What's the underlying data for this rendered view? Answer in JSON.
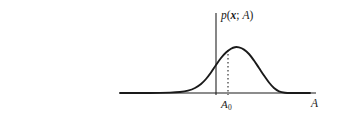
{
  "figure": {
    "kind": "probability-density-plot",
    "background_color": "#ffffff",
    "ink_color": "#1a1a1a",
    "labels": {
      "density_prefix": "p",
      "density_open_paren": "(",
      "density_variable": "x",
      "density_separator": "; ",
      "density_parameter": "A",
      "density_close_paren": ")",
      "density_full": "p(x; A)",
      "true_value_base": "A",
      "true_value_subscript": "0",
      "true_value_full": "A0",
      "x_axis_label": "A"
    }
  },
  "chart_data": {
    "type": "line",
    "title": "",
    "subtitle": "",
    "xlabel": "A",
    "ylabel": "p(x; A)",
    "grid": false,
    "legend": null,
    "axes": {
      "x_axis": {
        "label": "A",
        "start_px": 120,
        "end_px": 316,
        "y_px": 93,
        "arrow": false,
        "ticks": [],
        "tick_labels": []
      },
      "y_axis": {
        "label": "p(x; A)",
        "x_px": 216,
        "top_px": 13,
        "bottom_px": 95,
        "arrow": false,
        "ticks": [],
        "tick_labels": []
      }
    },
    "series": [
      {
        "name": "p(x; A)",
        "style": "solid",
        "color": "#1a1a1a",
        "line_width": 1.9,
        "description": "bell-shaped gaussian-like probability density curve",
        "peak_px": {
          "x": 235,
          "y": 47
        },
        "baseline_y_px": 93,
        "points_px": [
          {
            "x": 120,
            "y": 93
          },
          {
            "x": 150,
            "y": 93
          },
          {
            "x": 170,
            "y": 92.6
          },
          {
            "x": 180,
            "y": 92.0
          },
          {
            "x": 188,
            "y": 90.6
          },
          {
            "x": 195,
            "y": 88.0
          },
          {
            "x": 201,
            "y": 84.0
          },
          {
            "x": 206,
            "y": 79.0
          },
          {
            "x": 211,
            "y": 72.5
          },
          {
            "x": 216,
            "y": 65.0
          },
          {
            "x": 221,
            "y": 58.0
          },
          {
            "x": 226,
            "y": 52.5
          },
          {
            "x": 231,
            "y": 48.8
          },
          {
            "x": 235,
            "y": 47.2
          },
          {
            "x": 239,
            "y": 47.4
          },
          {
            "x": 244,
            "y": 49.6
          },
          {
            "x": 249,
            "y": 54.0
          },
          {
            "x": 254,
            "y": 60.5
          },
          {
            "x": 259,
            "y": 68.0
          },
          {
            "x": 264,
            "y": 75.5
          },
          {
            "x": 269,
            "y": 82.5
          },
          {
            "x": 274,
            "y": 88.0
          },
          {
            "x": 279,
            "y": 91.3
          },
          {
            "x": 285,
            "y": 92.7
          },
          {
            "x": 292,
            "y": 93.0
          },
          {
            "x": 310,
            "y": 93.0
          }
        ]
      }
    ],
    "annotations": [
      {
        "name": "peak-dropline",
        "type": "vertical-dashed-line",
        "label": "A0",
        "x_px": 228,
        "y_top_px": 50,
        "y_bottom_px": 95,
        "dash_pattern": "1.6 2.4",
        "color": "#1a1a1a"
      },
      {
        "name": "density-curve-label",
        "type": "text",
        "text": "p(x; A)",
        "x_px": 221,
        "y_px": 10
      },
      {
        "name": "true-parameter-label",
        "type": "text",
        "text": "A0",
        "x_px": 221,
        "y_px": 99
      },
      {
        "name": "x-axis-name-label",
        "type": "text",
        "text": "A",
        "x_px": 311,
        "y_px": 98
      }
    ]
  }
}
